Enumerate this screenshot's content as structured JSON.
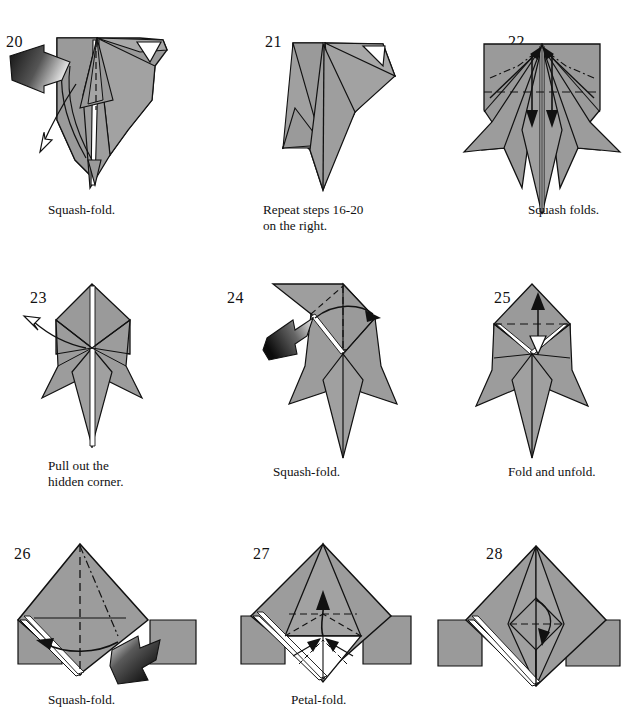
{
  "document": {
    "type": "origami-instruction-diagram",
    "page_width": 625,
    "page_height": 720,
    "background_color": "#ffffff",
    "paper_fill": "#9a9a9a",
    "paper_fill_light": "#b0b0b0",
    "paper_back": "#ffffff",
    "line_color": "#111111",
    "arrow_color": "#000000"
  },
  "panels": [
    {
      "number": "20",
      "caption": "Squash-fold.",
      "number_x": 6,
      "number_y": 34,
      "caption_x": 48,
      "caption_y": 202,
      "annotations": [
        "push-arrow-left",
        "pull-out-arrow-down-left",
        "valley-fold-dashed"
      ]
    },
    {
      "number": "21",
      "caption": "Repeat steps 16-20\non the right.",
      "number_x": 50,
      "number_y": 34,
      "caption_x": 48,
      "caption_y": 202,
      "annotations": []
    },
    {
      "number": "22",
      "caption": "Squash folds.",
      "number_x": 78,
      "number_y": 34,
      "caption_x": 98,
      "caption_y": 202,
      "annotations": [
        "two-squash-arrows",
        "valley-fold-dashed",
        "mountain-fold-dashdot"
      ]
    },
    {
      "number": "23",
      "caption": "Pull out the\nhidden corner.",
      "number_x": 30,
      "number_y": 28,
      "caption_x": 48,
      "caption_y": 196,
      "annotations": [
        "pull-out-arrow-up-left"
      ]
    },
    {
      "number": "24",
      "caption": "Squash-fold.",
      "number_x": 12,
      "number_y": 28,
      "caption_x": 58,
      "caption_y": 202,
      "annotations": [
        "push-arrow-left",
        "rotate-arrow-right",
        "valley-fold-dashed"
      ]
    },
    {
      "number": "25",
      "caption": "Fold and unfold.",
      "number_x": 64,
      "number_y": 28,
      "caption_x": 78,
      "caption_y": 202,
      "annotations": [
        "fold-and-unfold-double-arrow",
        "valley-fold-dashed"
      ]
    },
    {
      "number": "26",
      "caption": "Squash-fold.",
      "number_x": 14,
      "number_y": 22,
      "caption_x": 48,
      "caption_y": 168,
      "annotations": [
        "push-arrow-from-right",
        "swing-arrow-left",
        "valley-fold-dashed",
        "mountain-fold-dashdot"
      ]
    },
    {
      "number": "27",
      "caption": "Petal-fold.",
      "number_x": 38,
      "number_y": 22,
      "caption_x": 76,
      "caption_y": 168,
      "annotations": [
        "petal-up-arrow",
        "two-inward-arrows",
        "valley-fold-dashed"
      ]
    },
    {
      "number": "28",
      "caption": "",
      "number_x": 56,
      "number_y": 22,
      "caption_x": 60,
      "caption_y": 168,
      "annotations": [
        "fold-over-arrow",
        "valley-fold-dashed"
      ]
    }
  ]
}
